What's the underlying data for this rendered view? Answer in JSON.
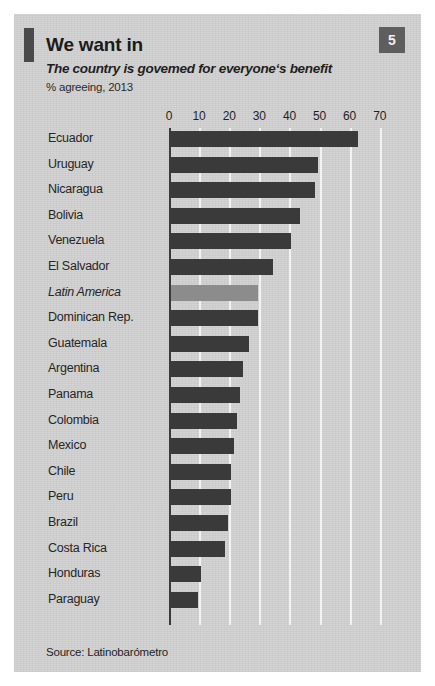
{
  "header": {
    "title": "We want in",
    "subtitle": "The country is govemed for everyone‘s benefit",
    "units": "% agreeing, 2013",
    "page_number": "5"
  },
  "footer": {
    "source": "Source: Latinobarómetro"
  },
  "colors": {
    "panel_background": "#d2d2d2",
    "bar_default": "#3a3a3a",
    "bar_highlight": "#8c8c8c",
    "gridline": "#f2f2f2",
    "axis": "#3a3a3a",
    "badge_background": "#5e5e5e",
    "accent_bar": "#4a4a4a",
    "text": "#262626"
  },
  "chart_data": {
    "type": "bar",
    "orientation": "horizontal",
    "title": "We want in",
    "subtitle": "The country is govemed for everyone‘s benefit",
    "xlabel": "% agreeing, 2013",
    "ylabel": "",
    "xlim": [
      0,
      70
    ],
    "xticks": [
      0,
      10,
      20,
      30,
      40,
      50,
      60,
      70
    ],
    "tick_labels": [
      "0",
      "10",
      "20",
      "30",
      "40",
      "50",
      "60",
      "70"
    ],
    "grid": true,
    "legend": false,
    "source": "Source: Latinobarómetro",
    "categories": [
      "Ecuador",
      "Uruguay",
      "Nicaragua",
      "Bolivia",
      "Venezuela",
      "El Salvador",
      "Latin America",
      "Dominican Rep.",
      "Guatemala",
      "Argentina",
      "Panama",
      "Colombia",
      "Mexico",
      "Chile",
      "Peru",
      "Brazil",
      "Costa Rica",
      "Honduras",
      "Paraguay"
    ],
    "values": [
      62,
      49,
      48,
      43,
      40,
      34,
      29,
      29,
      26,
      24,
      23,
      22,
      21,
      20,
      20,
      19,
      18,
      10,
      9
    ],
    "highlight_index": 6,
    "bars": [
      {
        "label": "Ecuador",
        "value": 62,
        "highlight": false
      },
      {
        "label": "Uruguay",
        "value": 49,
        "highlight": false
      },
      {
        "label": "Nicaragua",
        "value": 48,
        "highlight": false
      },
      {
        "label": "Bolivia",
        "value": 43,
        "highlight": false
      },
      {
        "label": "Venezuela",
        "value": 40,
        "highlight": false
      },
      {
        "label": "El Salvador",
        "value": 34,
        "highlight": false
      },
      {
        "label": "Latin America",
        "value": 29,
        "highlight": true
      },
      {
        "label": "Dominican Rep.",
        "value": 29,
        "highlight": false
      },
      {
        "label": "Guatemala",
        "value": 26,
        "highlight": false
      },
      {
        "label": "Argentina",
        "value": 24,
        "highlight": false
      },
      {
        "label": "Panama",
        "value": 23,
        "highlight": false
      },
      {
        "label": "Colombia",
        "value": 22,
        "highlight": false
      },
      {
        "label": "Mexico",
        "value": 21,
        "highlight": false
      },
      {
        "label": "Chile",
        "value": 20,
        "highlight": false
      },
      {
        "label": "Peru",
        "value": 20,
        "highlight": false
      },
      {
        "label": "Brazil",
        "value": 19,
        "highlight": false
      },
      {
        "label": "Costa Rica",
        "value": 18,
        "highlight": false
      },
      {
        "label": "Honduras",
        "value": 10,
        "highlight": false
      },
      {
        "label": "Paraguay",
        "value": 9,
        "highlight": false
      }
    ]
  }
}
